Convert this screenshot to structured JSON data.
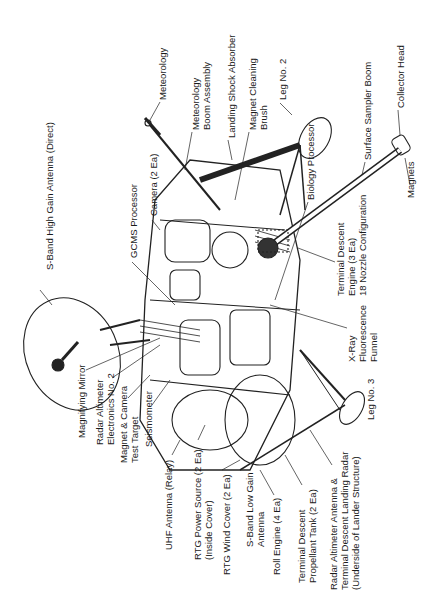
{
  "diagram": {
    "orientation": "rotated 90 degrees counter-clockwise",
    "labels": [
      {
        "id": "s-band-hga",
        "text": "S-Band High Gain Antenna (Direct)",
        "x": 44,
        "y": 270
      },
      {
        "id": "gcms",
        "text": "GCMS Processor",
        "x": 128,
        "y": 258
      },
      {
        "id": "camera",
        "text": "Camera (2 Ea)",
        "x": 148,
        "y": 216
      },
      {
        "id": "meteorology",
        "text": "Meteorology",
        "x": 157,
        "y": 100
      },
      {
        "id": "met-boom",
        "text": "Meteorology\nBoom Assembly",
        "x": 190,
        "y": 130
      },
      {
        "id": "landing-shock",
        "text": "Landing Shock Absorber",
        "x": 226,
        "y": 138
      },
      {
        "id": "magnet-brush",
        "text": "Magnet Cleaning\nBrush",
        "x": 247,
        "y": 130
      },
      {
        "id": "leg2",
        "text": "Leg No. 2",
        "x": 277,
        "y": 100
      },
      {
        "id": "biology",
        "text": "Biology Processor",
        "x": 305,
        "y": 200
      },
      {
        "id": "sampler-boom",
        "text": "Surface Sampler Boom",
        "x": 362,
        "y": 160
      },
      {
        "id": "collector-head",
        "text": "Collector Head",
        "x": 395,
        "y": 108
      },
      {
        "id": "magnets",
        "text": "Magnets",
        "x": 405,
        "y": 198
      },
      {
        "id": "td-engine",
        "text": "Terminal Descent\nEngine (3 Ea)\n18 Nozzle Configuration",
        "x": 335,
        "y": 296
      },
      {
        "id": "xray",
        "text": "X-Ray\nFluorescence\nFunnel",
        "x": 346,
        "y": 362
      },
      {
        "id": "leg3",
        "text": "Leg No. 3",
        "x": 365,
        "y": 420
      },
      {
        "id": "magnifying-mirror",
        "text": "Magnifying Mirror",
        "x": 76,
        "y": 438
      },
      {
        "id": "radar-alt-elec",
        "text": "Radar Altimeter\nElectronics No. 2",
        "x": 94,
        "y": 445
      },
      {
        "id": "magnet-camera",
        "text": "Magnet & Camera\nTest Target",
        "x": 118,
        "y": 463
      },
      {
        "id": "seismometer",
        "text": "Seismometer",
        "x": 143,
        "y": 447
      },
      {
        "id": "uhf",
        "text": "UHF Antenna (Relay)",
        "x": 163,
        "y": 550
      },
      {
        "id": "rtg-power",
        "text": "RTG Power Source (2 Ea)\n(Inside Cover)",
        "x": 192,
        "y": 560
      },
      {
        "id": "rtg-wind",
        "text": "RTG Wind Cover (2 Ea)",
        "x": 221,
        "y": 575
      },
      {
        "id": "s-band-lga",
        "text": "S-Band Low Gain\nAntenna",
        "x": 244,
        "y": 547
      },
      {
        "id": "roll-engine",
        "text": "Roll Engine (4 Ea)",
        "x": 271,
        "y": 575
      },
      {
        "id": "td-tank",
        "text": "Terminal Descent\nPropellant Tank (2 Ea)",
        "x": 296,
        "y": 583
      },
      {
        "id": "radar-alt-antenna",
        "text": "Radar Altimeter Antenna &\nTerminal Descent Landing Radar\n(Underside of Lander Structure)",
        "x": 328,
        "y": 590
      }
    ]
  }
}
